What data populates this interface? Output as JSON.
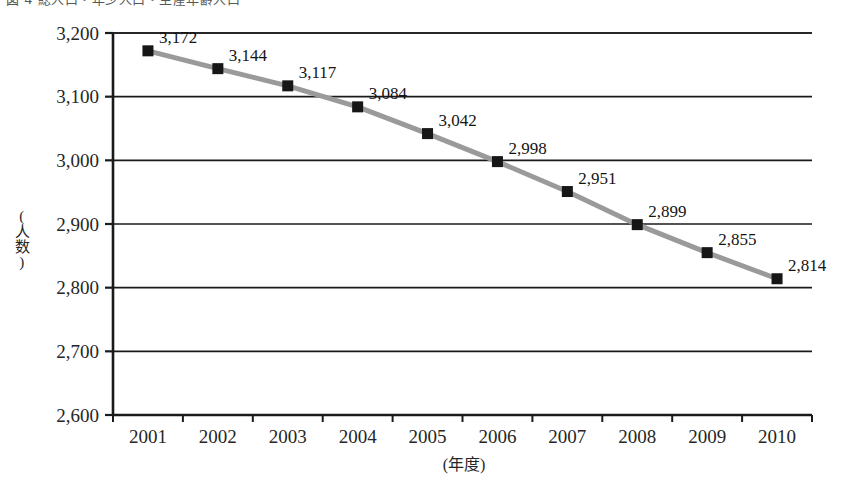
{
  "figure": {
    "caption_fragment": "図 4  総人口・年少人口・生産年齢人口",
    "background_color": "#ffffff"
  },
  "chart_data": {
    "type": "line",
    "title": "",
    "xlabel": "(年度)",
    "ylabel": "(人数)",
    "categories": [
      "2001",
      "2002",
      "2003",
      "2004",
      "2005",
      "2006",
      "2007",
      "2008",
      "2009",
      "2010"
    ],
    "values": [
      3172,
      3144,
      3117,
      3084,
      3042,
      2998,
      2951,
      2899,
      2855,
      2814
    ],
    "point_labels": [
      "3,172",
      "3,144",
      "3,117",
      "3,084",
      "3,042",
      "2,998",
      "2,951",
      "2,899",
      "2,855",
      "2,814"
    ],
    "ylim": [
      2600,
      3200
    ],
    "ytick_labels": [
      "3,200",
      "3,100",
      "3,000",
      "2,900",
      "2,800",
      "2,700",
      "2,600"
    ],
    "ytick_values": [
      3200,
      3100,
      3000,
      2900,
      2800,
      2700,
      2600
    ],
    "grid": true,
    "legend": "none",
    "series_color": "#9a9a9a",
    "marker_color": "#161616",
    "marker_shape": "square",
    "axis_color": "#1a1a1a"
  }
}
